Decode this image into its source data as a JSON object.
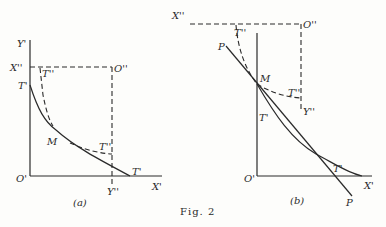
{
  "figure": {
    "caption": "Fig. 2",
    "panels": [
      {
        "id": "a",
        "sublabel": "(a)",
        "labels": {
          "y_axis": "Y'",
          "x_axis": "X'",
          "origin": "O'",
          "x2": "X''",
          "origin2": "O''",
          "y2": "Y''",
          "t_prime_top": "T'",
          "t_prime_right": "T'",
          "t_dprime_top": "T''",
          "t_dprime_right": "T''",
          "m": "M"
        }
      },
      {
        "id": "b",
        "sublabel": "(b)",
        "labels": {
          "x_axis": "X'",
          "origin": "O'",
          "x2": "X''",
          "origin2": "O''",
          "y2": "Y''",
          "t_prime_left": "T'",
          "t_prime_bottom": "T'",
          "t_dprime_top": "T''",
          "t_dprime_right": "T''",
          "m": "M",
          "p_top": "P",
          "p_bottom": "P"
        }
      }
    ]
  }
}
